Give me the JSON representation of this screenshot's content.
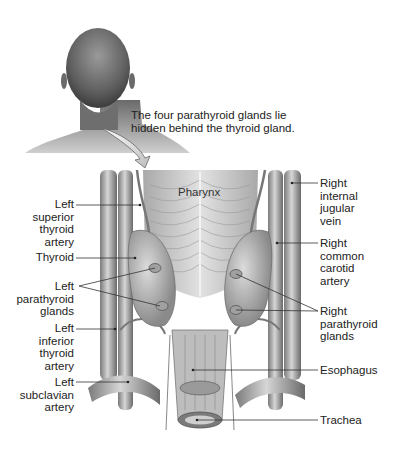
{
  "figure": {
    "caption_lines": [
      "The four parathyroid glands lie",
      "hidden behind the thyroid gland."
    ],
    "inset_image": "back-of-head-and-neck",
    "pointer": "curved-arrow-icon"
  },
  "inner_labels": {
    "pharynx": "Pharynx"
  },
  "left_labels": [
    {
      "lines": [
        "Left",
        "superior",
        "thyroid",
        "artery"
      ]
    },
    {
      "lines": [
        "Thyroid"
      ]
    },
    {
      "lines": [
        "Left",
        "parathyroid",
        "glands"
      ]
    },
    {
      "lines": [
        "Left",
        "inferior",
        "thyroid",
        "artery"
      ]
    },
    {
      "lines": [
        "Left",
        "subclavian",
        "artery"
      ]
    }
  ],
  "right_labels": [
    {
      "lines": [
        "Right",
        "internal",
        "jugular",
        "vein"
      ]
    },
    {
      "lines": [
        "Right",
        "common",
        "carotid",
        "artery"
      ]
    },
    {
      "lines": [
        "Right",
        "parathyroid",
        "glands"
      ]
    },
    {
      "lines": [
        "Esophagus"
      ]
    },
    {
      "lines": [
        "Trachea"
      ]
    }
  ],
  "colors": {
    "tissue_light": "#d9d9d9",
    "tissue_mid": "#a8a8a8",
    "tissue_dark": "#6e6e6e",
    "leader_line": "#333333"
  }
}
